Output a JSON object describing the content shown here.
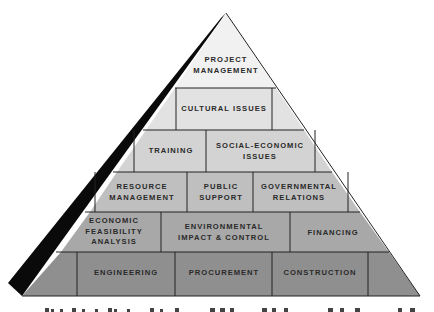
{
  "diagram": {
    "type": "pyramid",
    "colors": {
      "row1": "#f1f1f1",
      "row2": "#e2e2e2",
      "row3": "#d3d3d3",
      "row4": "#bfbfbf",
      "row5": "#a8a8a8",
      "row6": "#8f8f8f",
      "shadow": "#0a0a0a",
      "lines": "#222222"
    },
    "rows": [
      {
        "level": 1,
        "blocks": [
          {
            "label": "PROJECT\nMANAGEMENT"
          }
        ]
      },
      {
        "level": 2,
        "blocks": [
          {
            "label": "CULTURAL ISSUES"
          }
        ]
      },
      {
        "level": 3,
        "blocks": [
          {
            "label": "TRAINING"
          },
          {
            "label": "SOCIAL-ECONOMIC\nISSUES"
          }
        ]
      },
      {
        "level": 4,
        "blocks": [
          {
            "label": "RESOURCE\nMANAGEMENT"
          },
          {
            "label": "PUBLIC\nSUPPORT"
          },
          {
            "label": "GOVERNMENTAL\nRELATIONS"
          }
        ]
      },
      {
        "level": 5,
        "blocks": [
          {
            "label": "ECONOMIC\nFEASIBILITY\nANALYSIS"
          },
          {
            "label": "ENVIRONMENTAL\nIMPACT & CONTROL"
          },
          {
            "label": "FINANCING"
          }
        ]
      },
      {
        "level": 6,
        "blocks": [
          {
            "label": "ENGINEERING"
          },
          {
            "label": "PROCUREMENT"
          },
          {
            "label": "CONSTRUCTION"
          }
        ]
      }
    ]
  }
}
